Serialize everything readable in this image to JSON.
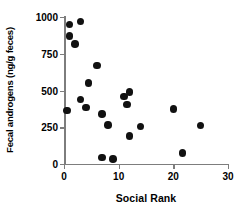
{
  "chart_data": {
    "type": "scatter",
    "title": "",
    "xlabel": "Social Rank",
    "ylabel": "Fecal androgens (ng/g feces)",
    "xlim": [
      0,
      30
    ],
    "ylim": [
      0,
      1000
    ],
    "xticks": [
      0,
      10,
      20,
      30
    ],
    "yticks": [
      0,
      250,
      500,
      750,
      1000
    ],
    "xticklabels": [
      "0",
      "10",
      "20",
      "30"
    ],
    "yticklabels": [
      "0",
      "250",
      "500",
      "750",
      "1000"
    ],
    "grid": false,
    "legend": null,
    "marker": {
      "shape": "circle",
      "color": "#111111",
      "size": 7.6
    },
    "axis_color": "#7d7d7d",
    "points": [
      {
        "x": 1.0,
        "y": 950
      },
      {
        "x": 3.0,
        "y": 970
      },
      {
        "x": 1.0,
        "y": 870
      },
      {
        "x": 2.0,
        "y": 815
      },
      {
        "x": 6.0,
        "y": 670
      },
      {
        "x": 4.5,
        "y": 550
      },
      {
        "x": 11.0,
        "y": 460
      },
      {
        "x": 12.0,
        "y": 490
      },
      {
        "x": 3.0,
        "y": 440
      },
      {
        "x": 11.5,
        "y": 405
      },
      {
        "x": 4.0,
        "y": 385
      },
      {
        "x": 0.5,
        "y": 365
      },
      {
        "x": 20.0,
        "y": 375
      },
      {
        "x": 7.0,
        "y": 340
      },
      {
        "x": 8.0,
        "y": 265
      },
      {
        "x": 14.0,
        "y": 255
      },
      {
        "x": 25.0,
        "y": 262
      },
      {
        "x": 12.0,
        "y": 192
      },
      {
        "x": 21.7,
        "y": 75
      },
      {
        "x": 7.0,
        "y": 45
      },
      {
        "x": 9.0,
        "y": 35
      }
    ]
  }
}
